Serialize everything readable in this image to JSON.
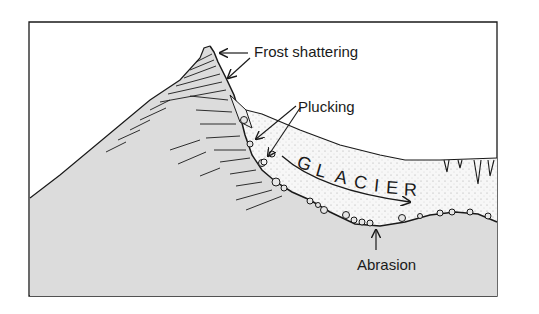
{
  "diagram": {
    "labels": {
      "frost_shattering": "Frost shattering",
      "plucking": "Plucking",
      "glacier": "GLACIER",
      "abrasion": "Abrasion"
    },
    "glacier_letters": [
      "G",
      "L",
      "A",
      "C",
      "I",
      "E",
      "R"
    ],
    "colors": {
      "rock": "#d9d9d9",
      "ice": "#f4f4f4",
      "line": "#1a1a1a",
      "background": "#ffffff"
    }
  }
}
